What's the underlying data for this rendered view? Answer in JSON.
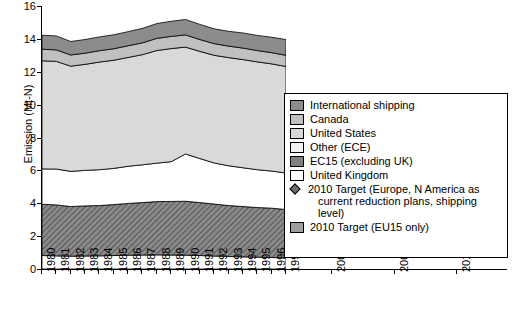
{
  "chart_data": {
    "type": "area",
    "title": "",
    "xlabel": "",
    "ylabel": "Emission (Mt-N)",
    "ylim": [
      0,
      16
    ],
    "yticks": [
      0,
      2,
      4,
      6,
      8,
      10,
      12,
      14,
      16
    ],
    "grid": false,
    "x_axis_left_labels": [
      "1980",
      "1981",
      "1982",
      "1983",
      "1984",
      "1985",
      "1986",
      "1987",
      "1988",
      "1989",
      "1990",
      "1991",
      "1992",
      "1993",
      "1994",
      "1995",
      "1996",
      "1997"
    ],
    "x_axis_right_labels": [
      "2000",
      "2005",
      "2010"
    ],
    "stack_order_bottom_to_top": [
      "United Kingdom",
      "EC15 (excluding UK)",
      "Other (ECE)",
      "United States",
      "Canada",
      "International shipping"
    ],
    "series": [
      {
        "name": "United Kingdom",
        "color": "#ffffff",
        "values": [
          0.82,
          0.8,
          0.78,
          0.79,
          0.8,
          0.82,
          0.84,
          0.85,
          0.86,
          0.85,
          0.84,
          0.82,
          0.79,
          0.76,
          0.74,
          0.72,
          0.7,
          0.67
        ]
      },
      {
        "name": "EC15 (excluding UK)",
        "color": "#7f7f7f",
        "values": [
          3.12,
          3.1,
          3.02,
          3.05,
          3.06,
          3.1,
          3.15,
          3.19,
          3.24,
          3.26,
          3.28,
          3.22,
          3.16,
          3.1,
          3.06,
          3.02,
          3.0,
          2.95
        ]
      },
      {
        "name": "Other (ECE)",
        "color": "#ffffff",
        "values": [
          2.15,
          2.18,
          2.14,
          2.16,
          2.18,
          2.2,
          2.26,
          2.3,
          2.34,
          2.42,
          2.88,
          2.68,
          2.5,
          2.42,
          2.36,
          2.3,
          2.26,
          2.22
        ]
      },
      {
        "name": "United States",
        "color": "#d9d9d9",
        "values": [
          6.58,
          6.55,
          6.4,
          6.45,
          6.55,
          6.58,
          6.62,
          6.7,
          6.85,
          6.88,
          6.5,
          6.52,
          6.55,
          6.58,
          6.58,
          6.56,
          6.52,
          6.48
        ]
      },
      {
        "name": "Canada",
        "color": "#c0c0c0",
        "values": [
          0.7,
          0.7,
          0.68,
          0.68,
          0.69,
          0.7,
          0.71,
          0.72,
          0.74,
          0.74,
          0.74,
          0.72,
          0.71,
          0.7,
          0.7,
          0.69,
          0.68,
          0.68
        ]
      },
      {
        "name": "International shipping",
        "color": "#8c8c8c",
        "values": [
          0.85,
          0.85,
          0.82,
          0.83,
          0.84,
          0.85,
          0.86,
          0.88,
          0.9,
          0.92,
          0.94,
          0.92,
          0.9,
          0.9,
          0.92,
          0.92,
          0.94,
          0.96
        ]
      }
    ],
    "markers": [
      {
        "name": "2010 Target (Europe, N America as current reduction plans, shipping level)",
        "shape": "diamond",
        "color": "#6e6e6e",
        "x": 2010,
        "y": 11.4
      },
      {
        "name": "2010 Target (EU15 only)",
        "shape": "square",
        "color": "#9d9d9d",
        "x": 2010,
        "y": 2.3
      }
    ]
  },
  "legend": {
    "items": [
      {
        "label": "International shipping",
        "color": "#8c8c8c",
        "shape": "square"
      },
      {
        "label": "Canada",
        "color": "#c0c0c0",
        "shape": "square"
      },
      {
        "label": "United States",
        "color": "#d9d9d9",
        "shape": "square"
      },
      {
        "label": "Other (ECE)",
        "color": "#ffffff",
        "shape": "square"
      },
      {
        "label": "EC15 (excluding UK)",
        "color": "#7f7f7f",
        "shape": "square"
      },
      {
        "label": "United Kingdom",
        "color": "#ffffff",
        "shape": "square"
      },
      {
        "label": "2010 Target (Europe, N America as",
        "label2": "current reduction plans, shipping level)",
        "color": "#6e6e6e",
        "shape": "diamond"
      },
      {
        "label": "2010 Target (EU15 only)",
        "color": "#9d9d9d",
        "shape": "square"
      }
    ]
  }
}
